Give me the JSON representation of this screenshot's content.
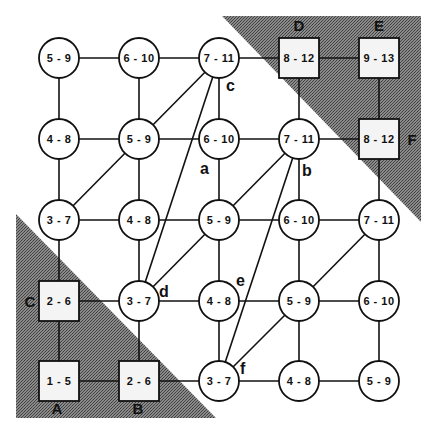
{
  "diagram": {
    "type": "grid-graph",
    "colors": {
      "shade": "#6e6e6e",
      "stroke": "#111111",
      "node_fill": "#ffffff",
      "square_fill": "#f4f4f4"
    },
    "nodes": [
      {
        "id": "n11",
        "label": "5 - 9",
        "shape": "circle",
        "x": 59,
        "y": 58
      },
      {
        "id": "n12",
        "label": "6 - 10",
        "shape": "circle",
        "x": 139,
        "y": 58
      },
      {
        "id": "n13",
        "label": "7 - 11",
        "shape": "circle",
        "x": 219,
        "y": 58
      },
      {
        "id": "n14",
        "label": "8 - 12",
        "shape": "square",
        "x": 299,
        "y": 58,
        "corner": "D"
      },
      {
        "id": "n15",
        "label": "9 - 13",
        "shape": "square",
        "x": 379,
        "y": 58,
        "corner": "E"
      },
      {
        "id": "n21",
        "label": "4 - 8",
        "shape": "circle",
        "x": 59,
        "y": 139
      },
      {
        "id": "n22",
        "label": "5 - 9",
        "shape": "circle",
        "x": 139,
        "y": 139
      },
      {
        "id": "n23",
        "label": "6 - 10",
        "shape": "circle",
        "x": 219,
        "y": 139
      },
      {
        "id": "n24",
        "label": "7 - 11",
        "shape": "circle",
        "x": 299,
        "y": 139
      },
      {
        "id": "n25",
        "label": "8 - 12",
        "shape": "square",
        "x": 379,
        "y": 139,
        "corner": "F"
      },
      {
        "id": "n31",
        "label": "3 - 7",
        "shape": "circle",
        "x": 59,
        "y": 220
      },
      {
        "id": "n32",
        "label": "4 - 8",
        "shape": "circle",
        "x": 139,
        "y": 220
      },
      {
        "id": "n33",
        "label": "5 - 9",
        "shape": "circle",
        "x": 219,
        "y": 220
      },
      {
        "id": "n34",
        "label": "6 - 10",
        "shape": "circle",
        "x": 299,
        "y": 220
      },
      {
        "id": "n35",
        "label": "7 - 11",
        "shape": "circle",
        "x": 379,
        "y": 220
      },
      {
        "id": "n41",
        "label": "2 - 6",
        "shape": "square",
        "x": 59,
        "y": 301,
        "corner": "C"
      },
      {
        "id": "n42",
        "label": "3 - 7",
        "shape": "circle",
        "x": 139,
        "y": 301
      },
      {
        "id": "n43",
        "label": "4 - 8",
        "shape": "circle",
        "x": 219,
        "y": 301
      },
      {
        "id": "n44",
        "label": "5 - 9",
        "shape": "circle",
        "x": 299,
        "y": 301
      },
      {
        "id": "n45",
        "label": "6 - 10",
        "shape": "circle",
        "x": 379,
        "y": 301
      },
      {
        "id": "n51",
        "label": "1 - 5",
        "shape": "square",
        "x": 59,
        "y": 381,
        "corner": "A"
      },
      {
        "id": "n52",
        "label": "2 - 6",
        "shape": "square",
        "x": 139,
        "y": 381,
        "corner": "B"
      },
      {
        "id": "n53",
        "label": "3 - 7",
        "shape": "circle",
        "x": 219,
        "y": 381
      },
      {
        "id": "n54",
        "label": "4 - 8",
        "shape": "circle",
        "x": 299,
        "y": 381
      },
      {
        "id": "n55",
        "label": "5 - 9",
        "shape": "circle",
        "x": 379,
        "y": 381
      }
    ],
    "edges": [
      [
        "n11",
        "n12"
      ],
      [
        "n12",
        "n13"
      ],
      [
        "n13",
        "n14"
      ],
      [
        "n14",
        "n15"
      ],
      [
        "n21",
        "n22"
      ],
      [
        "n22",
        "n23"
      ],
      [
        "n23",
        "n24"
      ],
      [
        "n24",
        "n25"
      ],
      [
        "n31",
        "n32"
      ],
      [
        "n32",
        "n33"
      ],
      [
        "n33",
        "n34"
      ],
      [
        "n34",
        "n35"
      ],
      [
        "n41",
        "n42"
      ],
      [
        "n42",
        "n43"
      ],
      [
        "n43",
        "n44"
      ],
      [
        "n44",
        "n45"
      ],
      [
        "n51",
        "n52"
      ],
      [
        "n52",
        "n53"
      ],
      [
        "n53",
        "n54"
      ],
      [
        "n54",
        "n55"
      ],
      [
        "n11",
        "n21"
      ],
      [
        "n21",
        "n31"
      ],
      [
        "n31",
        "n41"
      ],
      [
        "n41",
        "n51"
      ],
      [
        "n12",
        "n22"
      ],
      [
        "n22",
        "n32"
      ],
      [
        "n32",
        "n42"
      ],
      [
        "n42",
        "n52"
      ],
      [
        "n13",
        "n23"
      ],
      [
        "n23",
        "n33"
      ],
      [
        "n33",
        "n43"
      ],
      [
        "n43",
        "n53"
      ],
      [
        "n14",
        "n24"
      ],
      [
        "n24",
        "n34"
      ],
      [
        "n34",
        "n44"
      ],
      [
        "n44",
        "n54"
      ],
      [
        "n15",
        "n25"
      ],
      [
        "n25",
        "n35"
      ],
      [
        "n35",
        "n45"
      ],
      [
        "n45",
        "n55"
      ],
      [
        "n22",
        "n13"
      ],
      [
        "n31",
        "n22"
      ],
      [
        "n13",
        "n42"
      ],
      [
        "n42",
        "n33"
      ],
      [
        "n24",
        "n33"
      ],
      [
        "n24",
        "n53"
      ],
      [
        "n53",
        "n44"
      ],
      [
        "n44",
        "n35"
      ]
    ],
    "edge_labels": [
      {
        "text": "c",
        "x": 226,
        "y": 91
      },
      {
        "text": "a",
        "x": 200,
        "y": 174
      },
      {
        "text": "b",
        "x": 302,
        "y": 176
      },
      {
        "text": "d",
        "x": 159,
        "y": 297
      },
      {
        "text": "e",
        "x": 236,
        "y": 286
      },
      {
        "text": "f",
        "x": 240,
        "y": 374
      }
    ],
    "corner_labels": [
      {
        "text": "D",
        "x": 299,
        "y": 31
      },
      {
        "text": "E",
        "x": 379,
        "y": 31
      },
      {
        "text": "F",
        "x": 412,
        "y": 145
      },
      {
        "text": "C",
        "x": 30,
        "y": 307
      },
      {
        "text": "A",
        "x": 57,
        "y": 414
      },
      {
        "text": "B",
        "x": 138,
        "y": 414
      }
    ],
    "shaded_regions": [
      {
        "name": "top-right-triangle",
        "points": "222,16 421,16 421,222"
      },
      {
        "name": "bottom-left-triangle",
        "points": "16,214 16,418 216,418"
      }
    ]
  }
}
